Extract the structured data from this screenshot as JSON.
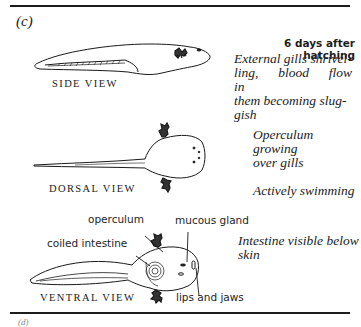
{
  "panel": {
    "label": "(c)"
  },
  "stage": {
    "heading": "6 days after hatching"
  },
  "views": [
    {
      "id": "side",
      "label": "SIDE VIEW",
      "description": "External gills shrivel-ling, blood flow in them becoming slug-gish",
      "description_lines": [
        "External gills shrivel-",
        "ling, blood flow in",
        "them becoming slug-",
        "gish"
      ]
    },
    {
      "id": "dorsal",
      "label": "DORSAL VIEW",
      "description_lines": [
        "Operculum growing",
        "over gills"
      ],
      "note": "Actively swimming"
    },
    {
      "id": "ventral",
      "label": "VENTRAL VIEW",
      "description_lines": [
        "Intestine visible below",
        "skin"
      ],
      "annotations": [
        {
          "id": "operculum",
          "text": "operculum"
        },
        {
          "id": "mucous-gland",
          "text": "mucous gland"
        },
        {
          "id": "coiled-intestine",
          "text": "coiled intestine"
        },
        {
          "id": "lips-and-jaws",
          "text": "lips and jaws"
        }
      ]
    }
  ],
  "footer": {
    "partial_text": "(d)"
  },
  "colors": {
    "ink": "#1a1a1a",
    "paper": "#ffffff"
  }
}
